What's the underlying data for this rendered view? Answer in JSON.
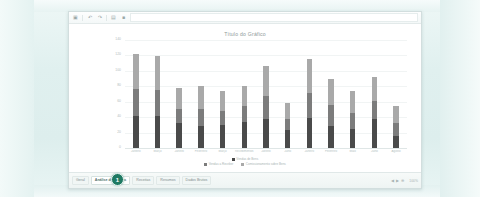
{
  "window": {
    "toolbar": {
      "icons": [
        "save-icon",
        "undo-icon",
        "redo-icon",
        "print-icon",
        "bold-icon"
      ],
      "formula_value": "",
      "formula_placeholder": ""
    }
  },
  "chart_data": {
    "type": "bar",
    "stacked": true,
    "title": "Título do Gráfico",
    "xlabel": "",
    "ylabel": "",
    "grid": true,
    "legend_position": "bottom",
    "ylim": [
      0,
      140
    ],
    "yticks": [
      "140",
      "120",
      "100",
      "80",
      "60",
      "40",
      "20",
      "0"
    ],
    "categories": [
      "Janeiro",
      "Março",
      "Janeiro",
      "Fevereiro",
      "Março",
      "Recebimentos",
      "Janeiro",
      "Julho",
      "Janeiro",
      "Fevereiro",
      "Maio",
      "Julho",
      "Agosto"
    ],
    "series": [
      {
        "name": "Vendas de Bens",
        "color": "#4a4a4a",
        "values": [
          42,
          42,
          32,
          28,
          30,
          34,
          37,
          24,
          39,
          29,
          25,
          37,
          16
        ]
      },
      {
        "name": "Vendas a Receber",
        "color": "#7c7c7c",
        "values": [
          34,
          33,
          19,
          22,
          18,
          20,
          30,
          14,
          32,
          27,
          21,
          24,
          17
        ]
      },
      {
        "name": "Comissionamento sobre Bens",
        "color": "#a9a9a9",
        "values": [
          46,
          44,
          27,
          30,
          26,
          26,
          39,
          21,
          44,
          33,
          28,
          31,
          21
        ]
      }
    ]
  },
  "tabbar": {
    "tabs": [
      {
        "label": "Geral",
        "active": false
      },
      {
        "label": "Análise de Vendas",
        "active": true
      },
      {
        "label": "Receitas",
        "active": false
      },
      {
        "label": "Resumos",
        "active": false
      },
      {
        "label": "Dados Brutos",
        "active": false
      }
    ],
    "badge": "1",
    "nav": {
      "prev": "◀",
      "next": "▶",
      "add": "⊕"
    },
    "zoom_label": "100%"
  }
}
